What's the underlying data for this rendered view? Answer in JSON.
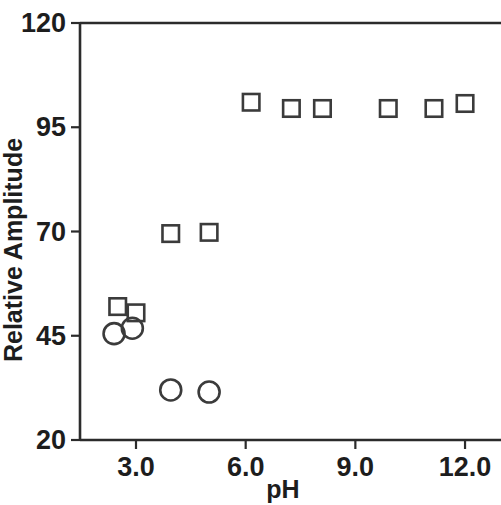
{
  "chart_data": {
    "type": "scatter",
    "title": "",
    "xlabel": "pH",
    "ylabel": "Relative Amplitude",
    "xlim": [
      2.0,
      12.6
    ],
    "ylim": [
      20,
      120
    ],
    "xticks": [
      "3.0",
      "6.0",
      "9.0",
      "12.0"
    ],
    "xtick_values": [
      3.0,
      6.0,
      9.0,
      12.0
    ],
    "yticks": [
      "20",
      "45",
      "70",
      "95",
      "120"
    ],
    "ytick_values": [
      20,
      45,
      70,
      95,
      120
    ],
    "grid": false,
    "legend": "none",
    "frame": "full-box",
    "series": [
      {
        "name": "open squares",
        "marker": "square",
        "marker_color": "#3b3b3b",
        "fill": "none",
        "points": [
          {
            "x": 2.5,
            "y": 52.0
          },
          {
            "x": 3.0,
            "y": 50.5
          },
          {
            "x": 3.95,
            "y": 69.5
          },
          {
            "x": 5.0,
            "y": 69.8
          },
          {
            "x": 6.15,
            "y": 101.0
          },
          {
            "x": 7.25,
            "y": 99.5
          },
          {
            "x": 8.1,
            "y": 99.5
          },
          {
            "x": 9.9,
            "y": 99.5
          },
          {
            "x": 11.15,
            "y": 99.5
          },
          {
            "x": 12.0,
            "y": 100.7
          }
        ]
      },
      {
        "name": "open circles",
        "marker": "circle",
        "marker_color": "#3b3b3b",
        "fill": "none",
        "points": [
          {
            "x": 2.4,
            "y": 45.5
          },
          {
            "x": 2.9,
            "y": 46.8
          },
          {
            "x": 3.95,
            "y": 32.0
          },
          {
            "x": 5.0,
            "y": 31.5
          }
        ]
      }
    ]
  }
}
